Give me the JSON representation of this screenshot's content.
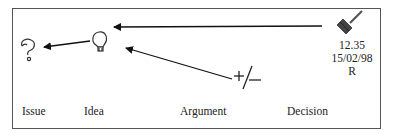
{
  "labels": {
    "issue": "Issue",
    "idea": "Idea",
    "argument": "Argument",
    "decision": "Decision"
  },
  "decision_info": {
    "time": "12.35",
    "date": "15/02/98",
    "initial": "R"
  },
  "argument_symbol": "+/—",
  "icons": {
    "issue": "question-mark-icon",
    "idea": "lightbulb-icon",
    "argument": "plus-minus-icon",
    "decision": "gavel-icon"
  },
  "colors": {
    "stroke": "#222222",
    "frame": "#555555",
    "gavel": "#444444"
  }
}
